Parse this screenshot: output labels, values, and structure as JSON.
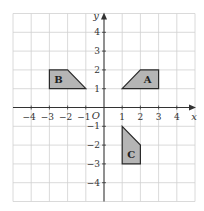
{
  "diagram": {
    "type": "coordinate-grid",
    "grid": {
      "xmin": -5,
      "xmax": 5,
      "ymin": -5,
      "ymax": 5,
      "color": "#d0d0d0"
    },
    "axes": {
      "x_label": "x",
      "y_label": "y",
      "origin_label": "O",
      "x_ticks": [
        -4,
        -3,
        -2,
        -1,
        1,
        2,
        3,
        4
      ],
      "y_ticks": [
        4,
        3,
        2,
        1,
        -1,
        -2,
        -3,
        -4
      ],
      "color": "#333333"
    },
    "shapes": [
      {
        "label": "A",
        "vertices": [
          [
            1,
            1
          ],
          [
            2,
            2
          ],
          [
            3,
            2
          ],
          [
            3,
            1
          ]
        ],
        "label_pos": [
          2.4,
          1.5
        ]
      },
      {
        "label": "B",
        "vertices": [
          [
            -3,
            2
          ],
          [
            -2,
            2
          ],
          [
            -1,
            1
          ],
          [
            -3,
            1
          ]
        ],
        "label_pos": [
          -2.5,
          1.5
        ]
      },
      {
        "label": "C",
        "vertices": [
          [
            1,
            -1
          ],
          [
            2,
            -2
          ],
          [
            2,
            -3
          ],
          [
            1,
            -3
          ]
        ],
        "label_pos": [
          1.5,
          -2.5
        ]
      }
    ],
    "shape_fill": "#b5b5b5",
    "shape_stroke": "#2a2a2a"
  }
}
